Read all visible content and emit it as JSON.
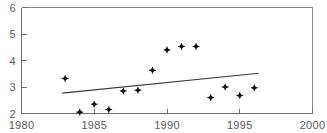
{
  "chart_data": {
    "type": "scatter",
    "title": "",
    "xlabel": "",
    "ylabel": "",
    "xlim": [
      1980,
      2000
    ],
    "ylim": [
      2,
      6
    ],
    "xticks": [
      1980,
      1985,
      1990,
      1995,
      2000
    ],
    "yticks": [
      2,
      3,
      4,
      5,
      6
    ],
    "xtick_labels": [
      "1980",
      "1985",
      "1990",
      "1995",
      "2000"
    ],
    "ytick_labels": [
      "2",
      "3",
      "4",
      "5",
      "6"
    ],
    "grid": false,
    "legend": "none",
    "marker": "filled-diamond",
    "marker_color": "#111111",
    "series": [
      {
        "name": "observations",
        "x": [
          1983,
          1984,
          1985,
          1986,
          1987,
          1988,
          1989,
          1990,
          1991,
          1992,
          1993,
          1994,
          1995,
          1996
        ],
        "values": [
          3.32,
          2.05,
          2.35,
          2.15,
          2.85,
          2.88,
          3.63,
          4.4,
          4.53,
          4.53,
          2.6,
          3.0,
          2.68,
          2.97
        ]
      }
    ],
    "trend_line": {
      "name": "linear-trend",
      "x_start": 1982.8,
      "y_start": 2.77,
      "x_end": 1996.3,
      "y_end": 3.52,
      "color": "#3a3a3a"
    },
    "frame": {
      "top": true,
      "right": true,
      "bottom": true,
      "left": true
    }
  },
  "axes": {
    "x_axis_name": "year-axis",
    "y_axis_name": "value-axis"
  },
  "artifacts": {
    "top_cropped_text": ""
  }
}
